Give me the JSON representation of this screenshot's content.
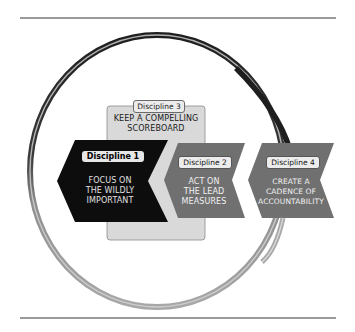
{
  "diagram": {
    "colors": {
      "rule": "#9a9a9a",
      "scoreboard_fill": "#d9d9d9",
      "discipline1_fill": "#0d0d0d",
      "chevron_fill": "#6e6e6e",
      "ring_dark": "#222222",
      "ring_light": "#b5b5b5"
    },
    "disciplines": [
      {
        "tag": "Discipline 1",
        "text": "FOCUS ON THE WILDLY IMPORTANT",
        "lines": [
          "FOCUS ON",
          "THE WILDLY",
          "IMPORTANT"
        ]
      },
      {
        "tag": "Discipline 2",
        "text": "ACT ON THE LEAD MEASURES",
        "lines": [
          "ACT ON",
          "THE LEAD",
          "MEASURES"
        ]
      },
      {
        "tag": "Discipline 3",
        "text": "KEEP A COMPELLING SCOREBOARD",
        "lines": [
          "KEEP A COMPELLING",
          "SCOREBOARD"
        ]
      },
      {
        "tag": "Discipline 4",
        "text": "CREATE A CADENCE OF ACCOUNTABILITY",
        "lines": [
          "CREATE A",
          "CADENCE OF",
          "ACCOUNTABILITY"
        ]
      }
    ]
  }
}
